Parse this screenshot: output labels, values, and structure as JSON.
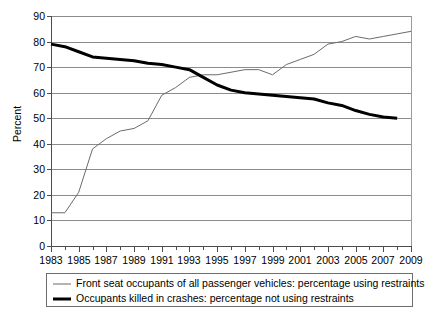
{
  "chart_data": {
    "type": "line",
    "title": "",
    "xlabel": "",
    "ylabel": "Percent",
    "ylim": [
      0,
      90
    ],
    "ytick_step": 10,
    "xlim": [
      1983,
      2009
    ],
    "grid": true,
    "legend_position": "bottom",
    "yticks": [
      "0",
      "10",
      "20",
      "30",
      "40",
      "50",
      "60",
      "70",
      "80",
      "90"
    ],
    "xticks": [
      "1983",
      "1985",
      "1987",
      "1989",
      "1991",
      "1993",
      "1995",
      "1997",
      "1999",
      "2001",
      "2003",
      "2005",
      "2007",
      "2009"
    ],
    "x": [
      1983,
      1984,
      1985,
      1986,
      1987,
      1988,
      1989,
      1990,
      1991,
      1992,
      1993,
      1994,
      1995,
      1996,
      1997,
      1998,
      1999,
      2000,
      2001,
      2002,
      2003,
      2004,
      2005,
      2006,
      2007,
      2008,
      2009
    ],
    "series": [
      {
        "name": "Front seat occupants of all passenger vehicles: percentage using restraints",
        "style": "thin",
        "color": "#6b6b6b",
        "values": [
          13,
          13,
          21,
          38,
          42,
          45,
          46,
          49,
          59,
          62,
          66,
          67,
          67,
          68,
          69,
          69,
          67,
          71,
          73,
          75,
          79,
          80,
          82,
          81,
          82,
          83,
          84
        ]
      },
      {
        "name": "Occupants killed in crashes: percentage not using restraints",
        "style": "thick",
        "color": "#000000",
        "values": [
          79,
          78,
          76,
          74,
          73.5,
          73,
          72.5,
          71.5,
          71,
          70,
          69,
          66,
          63,
          61,
          60,
          59.5,
          59,
          58.5,
          58,
          57.5,
          56,
          55,
          53,
          51.5,
          50.5,
          50,
          null
        ]
      }
    ]
  },
  "legend": {
    "entries": [
      {
        "label": "Front seat occupants of all passenger vehicles: percentage using restraints"
      },
      {
        "label": "Occupants killed in crashes: percentage not using restraints"
      }
    ]
  }
}
